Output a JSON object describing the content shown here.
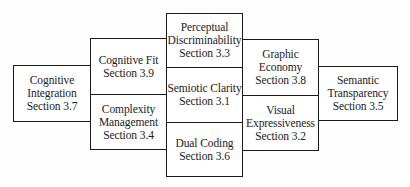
{
  "diagram": {
    "type": "principles-map",
    "boxes": [
      {
        "id": "cognitive-integration",
        "name": "Cognitive Integration",
        "section": "Section 3.7",
        "lines": [
          "Cognitive",
          "Integration",
          "Section 3.7"
        ]
      },
      {
        "id": "cognitive-fit",
        "name": "Cognitive Fit",
        "section": "Section 3.9",
        "lines": [
          "Cognitive Fit",
          "Section 3.9"
        ]
      },
      {
        "id": "complexity-management",
        "name": "Complexity Management",
        "section": "Section 3.4",
        "lines": [
          "Complexity",
          "Management",
          "Section 3.4"
        ]
      },
      {
        "id": "perceptual-discriminability",
        "name": "Perceptual Discriminability",
        "section": "Section 3.3",
        "lines": [
          "Perceptual",
          "Discriminability",
          "Section 3.3"
        ]
      },
      {
        "id": "semiotic-clarity",
        "name": "Semiotic Clarity",
        "section": "Section 3.1",
        "lines": [
          "Semiotic Clarity",
          "Section 3.1"
        ]
      },
      {
        "id": "dual-coding",
        "name": "Dual Coding",
        "section": "Section 3.6",
        "lines": [
          "Dual Coding",
          "Section 3.6"
        ]
      },
      {
        "id": "graphic-economy",
        "name": "Graphic Economy",
        "section": "Section 3.8",
        "lines": [
          "Graphic",
          "Economy",
          "Section 3.8"
        ]
      },
      {
        "id": "visual-expressiveness",
        "name": "Visual Expressiveness",
        "section": "Section 3.2",
        "lines": [
          "Visual",
          "Expressiveness",
          "Section 3.2"
        ]
      },
      {
        "id": "semantic-transparency",
        "name": "Semantic Transparency",
        "section": "Section 3.5",
        "lines": [
          "Semantic",
          "Transparency",
          "Section 3.5"
        ]
      }
    ],
    "colors": {
      "border": "#1a1a1a",
      "text": "#222222",
      "background": "#ffffff"
    }
  }
}
